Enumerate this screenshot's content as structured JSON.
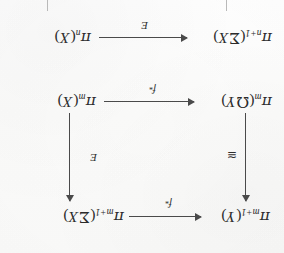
{
  "document": {
    "kind": "scanned-page",
    "content_type": "commutative-diagram",
    "orientation": "rotated-180",
    "background_color": "#fdfdfc",
    "ink_color": "#2b2b2b"
  },
  "diagram": {
    "nodes": [
      {
        "id": "top-left",
        "name": "pi-n-plus-1-sigma-x",
        "pi": "π",
        "subscript": "n+1",
        "open": "(",
        "operator": "Σ",
        "argument": "X",
        "close": ")",
        "text": "πn+1(ΣX)"
      },
      {
        "id": "top-right",
        "name": "pi-n-x",
        "pi": "π",
        "subscript": "n",
        "open": "(",
        "operator": "",
        "argument": "X",
        "close": ")",
        "text": "πn(X)"
      },
      {
        "id": "mid-left",
        "name": "pi-m-omega-y",
        "pi": "π",
        "subscript": "m",
        "open": "(",
        "operator": "Ω",
        "argument": "Y",
        "close": ")",
        "text": "πm(ΩY)"
      },
      {
        "id": "mid-right",
        "name": "pi-m-x",
        "pi": "π",
        "subscript": "m",
        "open": "(",
        "operator": "",
        "argument": "X",
        "close": ")",
        "text": "πm(X)"
      },
      {
        "id": "bottom-left",
        "name": "pi-m-plus-1-y",
        "pi": "π",
        "subscript": "m+1",
        "open": "(",
        "operator": "",
        "argument": "Y",
        "close": ")",
        "text": "πm+1(Y)"
      },
      {
        "id": "bottom-right",
        "name": "pi-m-plus-1-sigma-x",
        "pi": "π",
        "subscript": "m+1",
        "open": "(",
        "operator": "Σ",
        "argument": "X",
        "close": ")",
        "text": "πm+1(ΣX)"
      }
    ],
    "arrows": [
      {
        "id": "top-horizontal",
        "name": "arrow-suspension-top",
        "from": "top-right",
        "to": "top-left",
        "direction": "right-to-left",
        "label": "E",
        "label_star": ""
      },
      {
        "id": "mid-horizontal",
        "name": "arrow-f-star-middle",
        "from": "mid-right",
        "to": "mid-left",
        "direction": "right-to-left",
        "label": "f",
        "label_star": "*"
      },
      {
        "id": "bottom-horizontal",
        "name": "arrow-f-star-bottom",
        "from": "bottom-right",
        "to": "bottom-left",
        "direction": "right-to-left",
        "label": "f",
        "label_star": "*"
      },
      {
        "id": "left-vertical",
        "name": "arrow-iso-left",
        "from": "bottom-left",
        "to": "mid-left",
        "direction": "upward",
        "label": "≅",
        "label_star": ""
      },
      {
        "id": "right-vertical",
        "name": "arrow-suspension-right",
        "from": "bottom-right",
        "to": "mid-right",
        "direction": "upward",
        "label": "E",
        "label_star": ""
      }
    ]
  }
}
